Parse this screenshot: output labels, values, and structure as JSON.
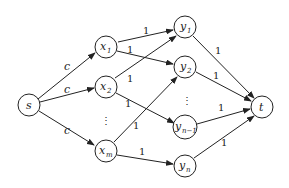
{
  "diagram": {
    "type": "flow-network",
    "nodes": {
      "s": {
        "label": "s",
        "sub": ""
      },
      "x1": {
        "label": "x",
        "sub": "1"
      },
      "x2": {
        "label": "x",
        "sub": "2"
      },
      "xm": {
        "label": "x",
        "sub": "m"
      },
      "y1": {
        "label": "y",
        "sub": "1"
      },
      "y2": {
        "label": "y",
        "sub": "2"
      },
      "yn1": {
        "label": "y",
        "sub": "n−1"
      },
      "yn": {
        "label": "y",
        "sub": "n"
      },
      "t": {
        "label": "t",
        "sub": ""
      }
    },
    "ellipsis": {
      "x_column": "⋮",
      "y_column": "⋮"
    },
    "edges": [
      {
        "from": "s",
        "to": "x1",
        "capacity": "c"
      },
      {
        "from": "s",
        "to": "x2",
        "capacity": "c"
      },
      {
        "from": "s",
        "to": "xm",
        "capacity": "c"
      },
      {
        "from": "x1",
        "to": "y1",
        "capacity": "1"
      },
      {
        "from": "x1",
        "to": "y2",
        "capacity": "1"
      },
      {
        "from": "x2",
        "to": "y1",
        "capacity": "1"
      },
      {
        "from": "x2",
        "to": "yn1",
        "capacity": "1"
      },
      {
        "from": "xm",
        "to": "y2",
        "capacity": "1"
      },
      {
        "from": "xm",
        "to": "yn",
        "capacity": "1"
      },
      {
        "from": "y1",
        "to": "t",
        "capacity": "1"
      },
      {
        "from": "y2",
        "to": "t",
        "capacity": "1"
      },
      {
        "from": "yn1",
        "to": "t",
        "capacity": "1"
      },
      {
        "from": "yn",
        "to": "t",
        "capacity": "1"
      }
    ]
  }
}
